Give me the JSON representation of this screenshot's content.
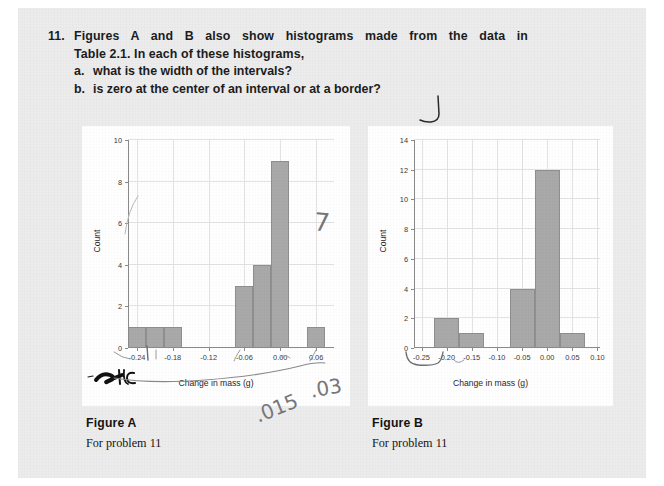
{
  "question": {
    "number": "11.",
    "line1": "Figures A and B also show histograms made from the data in",
    "line2": "Table 2.1. In each of these histograms,",
    "sub_a_letter": "a.",
    "sub_a_text": "what is the width of the intervals?",
    "sub_b_letter": "b.",
    "sub_b_text": "is zero at the center of an interval or at a border?"
  },
  "figureA": {
    "caption_title": "Figure A",
    "caption_sub": "For problem 11"
  },
  "figureB": {
    "caption_title": "Figure B",
    "caption_sub": "For problem 11"
  },
  "annotations": {
    "mark_scribble": "4C",
    "mark_value_1": ".015",
    "mark_value_2": ".03",
    "mark_seven": "7"
  },
  "colors": {
    "page_background": "#ececed",
    "panel_background": "#ffffff",
    "bar_fill": "#a9a9a9",
    "bar_stroke": "#8f8f8f",
    "grid": "#e3e3e6",
    "axis": "#8a8a8a",
    "text": "#1c1c1c",
    "pencil": "#6f6f72"
  },
  "chart_data": [
    {
      "type": "bar",
      "title": "Figure A",
      "xlabel": "Change in mass (g)",
      "ylabel": "Count",
      "xlim": [
        -0.255,
        0.09
      ],
      "ylim": [
        0,
        10
      ],
      "xticks": [
        -0.24,
        -0.18,
        -0.12,
        -0.06,
        0.0,
        0.06
      ],
      "xtick_labels": [
        "-0.24",
        "-0.18",
        "-0.12",
        "-0.06",
        "0.00",
        "0.06"
      ],
      "yticks": [
        0,
        2,
        4,
        6,
        8,
        10
      ],
      "ytick_labels": [
        "0",
        "2",
        "4",
        "6",
        "8",
        "10"
      ],
      "bin_width": 0.03,
      "grid": true,
      "legend": "none",
      "bins": [
        {
          "left": -0.255,
          "right": -0.225,
          "count": 1
        },
        {
          "left": -0.225,
          "right": -0.195,
          "count": 1
        },
        {
          "left": -0.195,
          "right": -0.165,
          "count": 1
        },
        {
          "left": -0.075,
          "right": -0.045,
          "count": 3
        },
        {
          "left": -0.045,
          "right": -0.015,
          "count": 4
        },
        {
          "left": -0.015,
          "right": 0.015,
          "count": 9
        },
        {
          "left": 0.045,
          "right": 0.075,
          "count": 1
        }
      ]
    },
    {
      "type": "bar",
      "title": "Figure B",
      "xlabel": "Change in mass (g)",
      "ylabel": "Count",
      "xlim": [
        -0.265,
        0.105
      ],
      "ylim": [
        0,
        14
      ],
      "xticks": [
        -0.25,
        -0.2,
        -0.15,
        -0.1,
        -0.05,
        0.0,
        0.05,
        0.1
      ],
      "xtick_labels": [
        "-0.25",
        "-0.20",
        "-0.15",
        "-0.10",
        "-0.05",
        "0.00",
        "0.05",
        "0.10"
      ],
      "yticks": [
        0,
        2,
        4,
        6,
        8,
        10,
        12,
        14
      ],
      "ytick_labels": [
        "0",
        "2",
        "4",
        "6",
        "8",
        "10",
        "12",
        "14"
      ],
      "bin_width": 0.05,
      "grid": true,
      "legend": "none",
      "bins": [
        {
          "left": -0.225,
          "right": -0.175,
          "count": 2
        },
        {
          "left": -0.175,
          "right": -0.125,
          "count": 1
        },
        {
          "left": -0.075,
          "right": -0.025,
          "count": 4
        },
        {
          "left": -0.025,
          "right": 0.025,
          "count": 12
        },
        {
          "left": 0.025,
          "right": 0.075,
          "count": 1
        }
      ]
    }
  ]
}
